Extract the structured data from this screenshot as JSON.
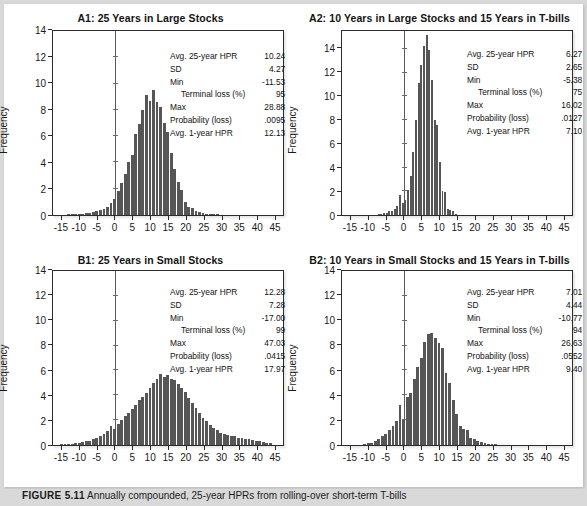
{
  "figure": {
    "background_color": "#d9d9d9",
    "card_color": "#ffffff",
    "bar_color": "#565656",
    "axis_color": "#2b2b2b",
    "caption_label": "FIGURE 5.11",
    "caption_body": "Annually compounded, 25-year HPRs from rolling-over short-term T-bills"
  },
  "stat_labels": {
    "avg25": "Avg. 25-year HPR",
    "sd": "SD",
    "min": "Min",
    "terminal_loss": "Terminal loss (%)",
    "max": "Max",
    "prob_loss": "Probability (loss)",
    "avg1": "Avg. 1-year HPR"
  },
  "axes": {
    "ylabel": "Frequency",
    "xticks": [
      "-15",
      "-10",
      "-5",
      "0",
      "5",
      "10",
      "15",
      "20",
      "25",
      "30",
      "35",
      "40",
      "45"
    ],
    "xtick_values": [
      -15,
      -10,
      -5,
      0,
      5,
      10,
      15,
      20,
      25,
      30,
      35,
      40,
      45
    ],
    "yticks_standard": [
      "0",
      "2",
      "4",
      "6",
      "8",
      "10",
      "12",
      "14"
    ],
    "ytick_values": [
      0,
      2,
      4,
      6,
      8,
      10,
      12,
      14
    ],
    "xlim": [
      -17.5,
      47.5
    ]
  },
  "chart_data": [
    {
      "id": "A1",
      "type": "bar",
      "title": "A1: 25 Years in Large Stocks",
      "xlabel": "",
      "ylabel": "Frequency",
      "xlim": [
        -17.5,
        47.5
      ],
      "ylim": [
        0,
        14
      ],
      "grid": false,
      "legend": "none",
      "bin_width": 1,
      "x": [
        -13,
        -12,
        -11,
        -10,
        -9,
        -8,
        -7,
        -6,
        -5,
        -4,
        -3,
        -2,
        -1,
        0,
        1,
        2,
        3,
        4,
        5,
        6,
        7,
        8,
        9,
        10,
        11,
        12,
        13,
        14,
        15,
        16,
        17,
        18,
        19,
        20,
        21,
        22,
        23,
        24,
        25,
        26,
        27,
        28,
        29
      ],
      "values": [
        0.05,
        0.05,
        0.05,
        0.08,
        0.1,
        0.12,
        0.15,
        0.2,
        0.3,
        0.35,
        0.45,
        0.6,
        0.9,
        1.2,
        1.8,
        2.4,
        3.1,
        4.0,
        4.6,
        6.2,
        6.9,
        8.0,
        9.1,
        8.7,
        9.5,
        8.6,
        8.2,
        7.0,
        6.3,
        4.7,
        3.5,
        2.5,
        1.9,
        1.0,
        0.6,
        0.55,
        0.3,
        0.2,
        0.12,
        0.1,
        0.08,
        0.06,
        0.04
      ],
      "stats": {
        "avg25": "10.24",
        "sd": "4.27",
        "min": "-11.53",
        "terminal_loss": "95",
        "max": "28.88",
        "prob_loss": ".0095",
        "avg1": "12.13"
      }
    },
    {
      "id": "A2",
      "type": "bar",
      "title": "A2: 10 Years in Large Stocks and 15 Years in T-bills",
      "xlabel": "",
      "ylabel": "Frequency",
      "xlim": [
        -17.5,
        47.5
      ],
      "ylim": [
        0,
        15.5
      ],
      "grid": false,
      "legend": "none",
      "bin_width": 0.75,
      "x": [
        -7,
        -6.25,
        -5.5,
        -4.75,
        -4,
        -3.25,
        -2.5,
        -1.75,
        -1,
        -0.25,
        0.5,
        1.25,
        2,
        2.75,
        3.5,
        4.25,
        5,
        5.75,
        6.5,
        7.25,
        8,
        8.75,
        9.5,
        10.25,
        11,
        11.75,
        12.5,
        13.25,
        14,
        14.75
      ],
      "values": [
        0.08,
        0.1,
        0.15,
        0.2,
        0.3,
        0.35,
        0.5,
        0.8,
        1.7,
        1.0,
        1.3,
        2.1,
        3.3,
        5.3,
        8.0,
        11.1,
        12.6,
        14.2,
        15.2,
        13.9,
        11.4,
        8.0,
        7.6,
        4.5,
        2.0,
        1.9,
        0.5,
        0.45,
        0.3,
        0.1
      ],
      "stats": {
        "avg25": "6.27",
        "sd": "2.65",
        "min": "-5.38",
        "terminal_loss": "75",
        "max": "16.02",
        "prob_loss": ".0127",
        "avg1": "7.10"
      }
    },
    {
      "id": "B1",
      "type": "bar",
      "title": "B1: 25 Years in Small Stocks",
      "xlabel": "",
      "ylabel": "Frequency",
      "xlim": [
        -17.5,
        47.5
      ],
      "ylim": [
        0,
        14
      ],
      "grid": false,
      "legend": "none",
      "bin_width": 1,
      "x": [
        -15,
        -14,
        -13,
        -12,
        -11,
        -10,
        -9,
        -8,
        -7,
        -6,
        -5,
        -4,
        -3,
        -2,
        -1,
        0,
        1,
        2,
        3,
        4,
        5,
        6,
        7,
        8,
        9,
        10,
        11,
        12,
        13,
        14,
        15,
        16,
        17,
        18,
        19,
        20,
        21,
        22,
        23,
        24,
        25,
        26,
        27,
        28,
        29,
        30,
        31,
        32,
        33,
        34,
        35,
        36,
        37,
        38,
        39,
        40,
        41,
        42,
        43,
        44
      ],
      "values": [
        0.05,
        0.08,
        0.1,
        0.12,
        0.15,
        0.2,
        0.25,
        0.3,
        0.35,
        0.45,
        0.55,
        0.7,
        0.9,
        1.15,
        1.5,
        1.3,
        1.7,
        2.0,
        2.3,
        2.6,
        2.9,
        3.2,
        3.6,
        3.9,
        4.2,
        4.6,
        5.0,
        5.3,
        5.7,
        5.5,
        5.6,
        5.3,
        5.2,
        4.9,
        4.6,
        4.3,
        3.8,
        3.4,
        3.0,
        2.6,
        2.2,
        1.9,
        1.6,
        1.4,
        1.2,
        1.0,
        0.9,
        0.8,
        0.75,
        0.7,
        0.6,
        0.55,
        0.5,
        0.45,
        0.4,
        0.35,
        0.3,
        0.25,
        0.2,
        0.15
      ],
      "stats": {
        "avg25": "12.28",
        "sd": "7.28",
        "min": "-17.00",
        "terminal_loss": "99",
        "max": "47.03",
        "prob_loss": ".0415",
        "avg1": "17.97"
      }
    },
    {
      "id": "B2",
      "type": "bar",
      "title": "B2: 10 Years in Small Stocks and 15 Years in T-bills",
      "xlabel": "",
      "ylabel": "Frequency",
      "xlim": [
        -17.5,
        47.5
      ],
      "ylim": [
        0,
        14
      ],
      "grid": false,
      "legend": "none",
      "bin_width": 1,
      "x": [
        -11,
        -10,
        -9,
        -8,
        -7,
        -6,
        -5,
        -4,
        -3,
        -2,
        -1,
        0,
        1,
        2,
        3,
        4,
        5,
        6,
        7,
        8,
        9,
        10,
        11,
        12,
        13,
        14,
        15,
        16,
        17,
        18,
        19,
        20,
        21,
        22,
        23,
        24,
        25,
        26
      ],
      "values": [
        0.1,
        0.15,
        0.2,
        0.35,
        0.5,
        0.7,
        0.9,
        1.2,
        1.5,
        1.9,
        3.2,
        2.0,
        3.9,
        4.2,
        5.3,
        6.3,
        7.0,
        8.3,
        8.9,
        9.0,
        8.6,
        8.2,
        7.8,
        5.8,
        5.0,
        3.6,
        2.5,
        1.5,
        1.3,
        1.2,
        0.6,
        0.5,
        0.3,
        0.25,
        0.15,
        0.1,
        0.08,
        0.05
      ],
      "stats": {
        "avg25": "7.01",
        "sd": "4.44",
        "min": "-10.77",
        "terminal_loss": "94",
        "max": "26.63",
        "prob_loss": ".0552",
        "avg1": "9.40"
      }
    }
  ]
}
